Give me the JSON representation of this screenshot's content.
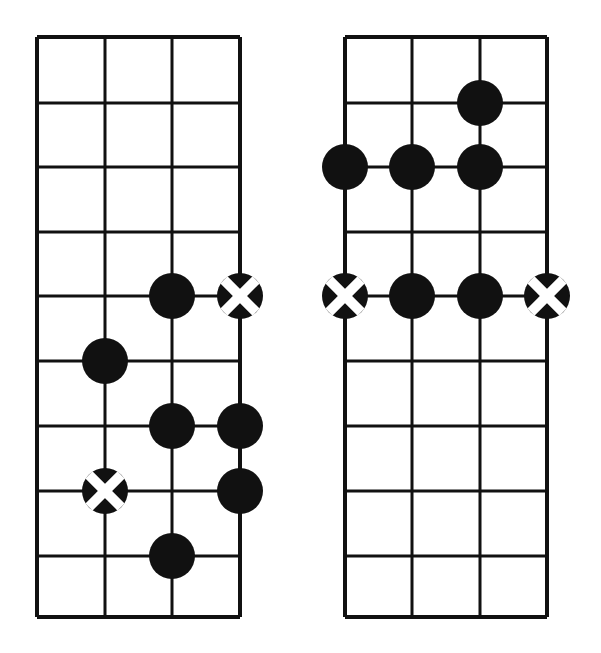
{
  "figure": {
    "kind": "chord-diagram-pair",
    "width": 601,
    "height": 653,
    "background": "#ffffff",
    "ink": "#111111",
    "marker_cross_color": "#ffffff"
  },
  "chart_data": {
    "type": "diagram",
    "title": "",
    "subtitle": "",
    "xlabel": "",
    "ylabel": "",
    "grid": true,
    "legend": [],
    "annotations": [],
    "diagrams": [
      {
        "id": "left-fretboard",
        "name": "left-chord-diagram",
        "grid": {
          "strings": 4,
          "fret_lines": 10,
          "x_left": 37,
          "x_right": 240,
          "y_top": 37,
          "y_bottom": 617,
          "string_x": [
            37,
            105,
            172,
            240
          ],
          "fret_y": [
            37,
            103,
            167,
            232,
            296,
            361,
            426,
            491,
            556,
            617
          ],
          "line_width_outer": 4,
          "line_width_inner": 3
        },
        "markers": [
          {
            "type": "filled",
            "string": 3,
            "fret_line": 5,
            "cx": 172,
            "cy": 296,
            "r": 23
          },
          {
            "type": "crossed",
            "string": 4,
            "fret_line": 5,
            "cx": 240,
            "cy": 296,
            "r": 23
          },
          {
            "type": "filled",
            "string": 2,
            "fret_line": 6,
            "cx": 105,
            "cy": 361,
            "r": 23
          },
          {
            "type": "filled",
            "string": 3,
            "fret_line": 7,
            "cx": 172,
            "cy": 426,
            "r": 23
          },
          {
            "type": "filled",
            "string": 4,
            "fret_line": 7,
            "cx": 240,
            "cy": 426,
            "r": 23
          },
          {
            "type": "crossed",
            "string": 2,
            "fret_line": 8,
            "cx": 105,
            "cy": 491,
            "r": 23
          },
          {
            "type": "filled",
            "string": 4,
            "fret_line": 8,
            "cx": 240,
            "cy": 491,
            "r": 23
          },
          {
            "type": "filled",
            "string": 3,
            "fret_line": 9,
            "cx": 172,
            "cy": 556,
            "r": 23
          }
        ],
        "marker_counts": {
          "filled": 6,
          "crossed": 2,
          "total": 8
        }
      },
      {
        "id": "right-fretboard",
        "name": "right-chord-diagram",
        "grid": {
          "strings": 4,
          "fret_lines": 10,
          "x_left": 345,
          "x_right": 547,
          "y_top": 37,
          "y_bottom": 617,
          "string_x": [
            345,
            412,
            480,
            547
          ],
          "fret_y": [
            37,
            103,
            167,
            232,
            296,
            361,
            426,
            491,
            556,
            617
          ],
          "line_width_outer": 4,
          "line_width_inner": 3
        },
        "markers": [
          {
            "type": "filled",
            "string": 3,
            "fret_line": 2,
            "cx": 480,
            "cy": 103,
            "r": 23
          },
          {
            "type": "filled",
            "string": 1,
            "fret_line": 3,
            "cx": 345,
            "cy": 167,
            "r": 23
          },
          {
            "type": "filled",
            "string": 2,
            "fret_line": 3,
            "cx": 412,
            "cy": 167,
            "r": 23
          },
          {
            "type": "filled",
            "string": 3,
            "fret_line": 3,
            "cx": 480,
            "cy": 167,
            "r": 23
          },
          {
            "type": "crossed",
            "string": 1,
            "fret_line": 5,
            "cx": 345,
            "cy": 296,
            "r": 23
          },
          {
            "type": "filled",
            "string": 2,
            "fret_line": 5,
            "cx": 412,
            "cy": 296,
            "r": 23
          },
          {
            "type": "filled",
            "string": 3,
            "fret_line": 5,
            "cx": 480,
            "cy": 296,
            "r": 23
          },
          {
            "type": "crossed",
            "string": 4,
            "fret_line": 5,
            "cx": 547,
            "cy": 296,
            "r": 23
          }
        ],
        "marker_counts": {
          "filled": 6,
          "crossed": 2,
          "total": 8
        }
      }
    ]
  }
}
